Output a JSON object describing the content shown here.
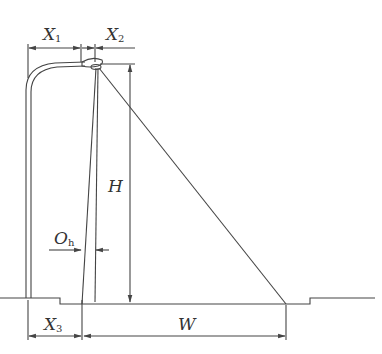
{
  "diagram": {
    "labels": {
      "x1": {
        "main": "X",
        "sub": "1"
      },
      "x2": {
        "main": "X",
        "sub": "2"
      },
      "x3": {
        "main": "X",
        "sub": "3"
      },
      "h": {
        "main": "H"
      },
      "oh": {
        "main": "O",
        "sub": "h"
      },
      "w": {
        "main": "W"
      }
    },
    "colors": {
      "line": "#444444",
      "text": "#333333",
      "background": "#ffffff"
    }
  }
}
